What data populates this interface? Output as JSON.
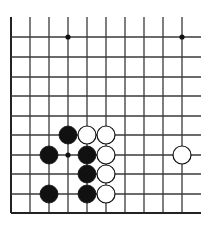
{
  "board": {
    "description": "Go board fragment (bottom-left corner region, open top and right edges)",
    "columns_x": [
      11,
      30,
      49,
      68,
      87,
      106,
      125,
      144,
      163,
      182
    ],
    "rows_y": [
      37,
      57,
      77,
      96,
      116,
      135,
      155,
      174,
      194,
      213
    ],
    "vertical_line_top": 17,
    "horizontal_line_right": 201,
    "line_color": "#3a3a3a",
    "edge_color": "#222222",
    "stone_radius": 9,
    "star_points": [
      {
        "col": 3,
        "row": 0
      },
      {
        "col": 9,
        "row": 0
      },
      {
        "col": 3,
        "row": 6
      }
    ],
    "stones": [
      {
        "color": "black",
        "col": 3,
        "row": 5
      },
      {
        "color": "white",
        "col": 4,
        "row": 5
      },
      {
        "color": "white",
        "col": 5,
        "row": 5
      },
      {
        "color": "black",
        "col": 2,
        "row": 6
      },
      {
        "color": "black",
        "col": 4,
        "row": 6
      },
      {
        "color": "white",
        "col": 5,
        "row": 6
      },
      {
        "color": "white",
        "col": 9,
        "row": 6
      },
      {
        "color": "black",
        "col": 4,
        "row": 7
      },
      {
        "color": "white",
        "col": 5,
        "row": 7
      },
      {
        "color": "black",
        "col": 2,
        "row": 8
      },
      {
        "color": "black",
        "col": 4,
        "row": 8
      },
      {
        "color": "white",
        "col": 5,
        "row": 8
      }
    ]
  }
}
